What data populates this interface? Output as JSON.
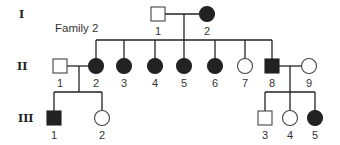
{
  "title": "Family 2",
  "colors": {
    "affected": "#222222",
    "unaffected": "#ffffff",
    "line": "#222222"
  },
  "generations": [
    {
      "label": "I",
      "y": 14
    },
    {
      "label": "II",
      "y": 66
    },
    {
      "label": "III",
      "y": 118
    }
  ],
  "individuals": [
    {
      "id": "I-1",
      "gen": "I",
      "number": "1",
      "sex": "male",
      "affected": false,
      "x": 158,
      "y": 14
    },
    {
      "id": "I-2",
      "gen": "I",
      "number": "2",
      "sex": "female",
      "affected": true,
      "x": 207,
      "y": 14
    },
    {
      "id": "II-1",
      "gen": "II",
      "number": "1",
      "sex": "male",
      "affected": false,
      "x": 60,
      "y": 66
    },
    {
      "id": "II-2",
      "gen": "II",
      "number": "2",
      "sex": "female",
      "affected": true,
      "x": 96,
      "y": 66
    },
    {
      "id": "II-3",
      "gen": "II",
      "number": "3",
      "sex": "female",
      "affected": true,
      "x": 124,
      "y": 66
    },
    {
      "id": "II-4",
      "gen": "II",
      "number": "4",
      "sex": "female",
      "affected": true,
      "x": 155,
      "y": 66
    },
    {
      "id": "II-5",
      "gen": "II",
      "number": "5",
      "sex": "female",
      "affected": true,
      "x": 184,
      "y": 66
    },
    {
      "id": "II-6",
      "gen": "II",
      "number": "6",
      "sex": "female",
      "affected": true,
      "x": 215,
      "y": 66
    },
    {
      "id": "II-7",
      "gen": "II",
      "number": "7",
      "sex": "female",
      "affected": false,
      "x": 245,
      "y": 66
    },
    {
      "id": "II-8",
      "gen": "II",
      "number": "8",
      "sex": "male",
      "affected": true,
      "x": 272,
      "y": 66
    },
    {
      "id": "II-9",
      "gen": "II",
      "number": "9",
      "sex": "female",
      "affected": false,
      "x": 309,
      "y": 66
    },
    {
      "id": "III-1",
      "gen": "III",
      "number": "1",
      "sex": "male",
      "affected": true,
      "x": 54,
      "y": 118
    },
    {
      "id": "III-2",
      "gen": "III",
      "number": "2",
      "sex": "female",
      "affected": false,
      "x": 102,
      "y": 118
    },
    {
      "id": "III-3",
      "gen": "III",
      "number": "3",
      "sex": "male",
      "affected": false,
      "x": 265,
      "y": 118
    },
    {
      "id": "III-4",
      "gen": "III",
      "number": "4",
      "sex": "female",
      "affected": false,
      "x": 290,
      "y": 118
    },
    {
      "id": "III-5",
      "gen": "III",
      "number": "5",
      "sex": "female",
      "affected": true,
      "x": 315,
      "y": 118
    }
  ],
  "matings": [
    {
      "partners": [
        "I-1",
        "I-2"
      ],
      "children": [
        "II-2",
        "II-3",
        "II-4",
        "II-5",
        "II-6",
        "II-7",
        "II-8"
      ]
    },
    {
      "partners": [
        "II-1",
        "II-2"
      ],
      "children": [
        "III-1",
        "III-2"
      ]
    },
    {
      "partners": [
        "II-8",
        "II-9"
      ],
      "children": [
        "III-3",
        "III-4",
        "III-5"
      ]
    }
  ]
}
